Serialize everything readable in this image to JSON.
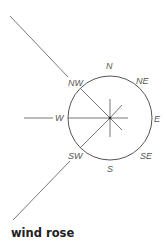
{
  "caption": "wind rose",
  "directions": {
    "N": "N",
    "NE": "NE",
    "E": "E",
    "SE": "SE",
    "S": "S",
    "SW": "SW",
    "W": "W",
    "NW": "NW"
  },
  "colors": {
    "line": "#555555",
    "text": "#222222",
    "background": "#ffffff"
  }
}
